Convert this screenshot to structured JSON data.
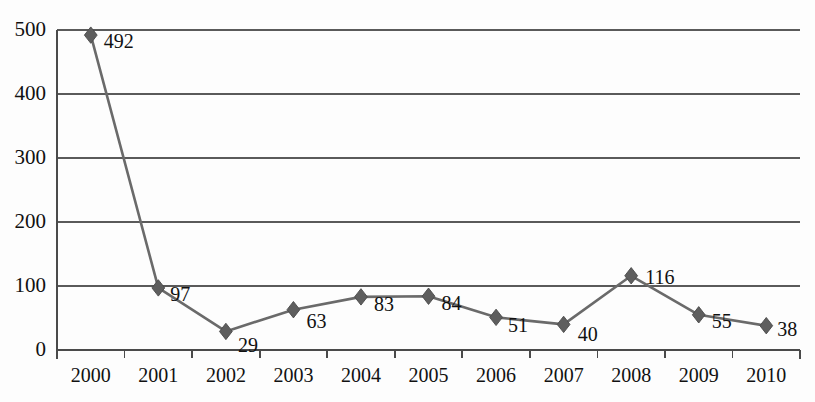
{
  "chart_data": {
    "type": "line",
    "title": "",
    "subtitle": "",
    "xlabel": "",
    "ylabel": "",
    "categories": [
      "2000",
      "2001",
      "2002",
      "2003",
      "2004",
      "2005",
      "2006",
      "2007",
      "2008",
      "2009",
      "2010"
    ],
    "values": [
      492,
      97,
      29,
      63,
      83,
      84,
      51,
      40,
      116,
      55,
      38
    ],
    "point_labels": [
      "492",
      "97",
      "29",
      "63",
      "83",
      "84",
      "51",
      "40",
      "116",
      "55",
      "38"
    ],
    "series": [
      {
        "name": "",
        "values": [
          492,
          97,
          29,
          63,
          83,
          84,
          51,
          40,
          116,
          55,
          38
        ]
      }
    ],
    "ylim": [
      0,
      500
    ],
    "ytick_values": [
      0,
      100,
      200,
      300,
      400,
      500
    ],
    "ytick_labels": [
      "0",
      "100",
      "200",
      "300",
      "400",
      "500"
    ],
    "grid": true,
    "grid_axis": "y",
    "legend": false,
    "legend_position": "none",
    "marker": "diamond",
    "colors": {
      "line": "#6a6a6a",
      "marker": "#5e5e5e",
      "grid": "#5a5a5a",
      "axis": "#4a4a4a",
      "text": "#111111",
      "background": "#fdfdfd"
    },
    "annotations": []
  },
  "layout": {
    "plot_left": 57,
    "plot_right": 800,
    "plot_top": 30,
    "plot_bottom": 350,
    "band_width": 67.55
  }
}
